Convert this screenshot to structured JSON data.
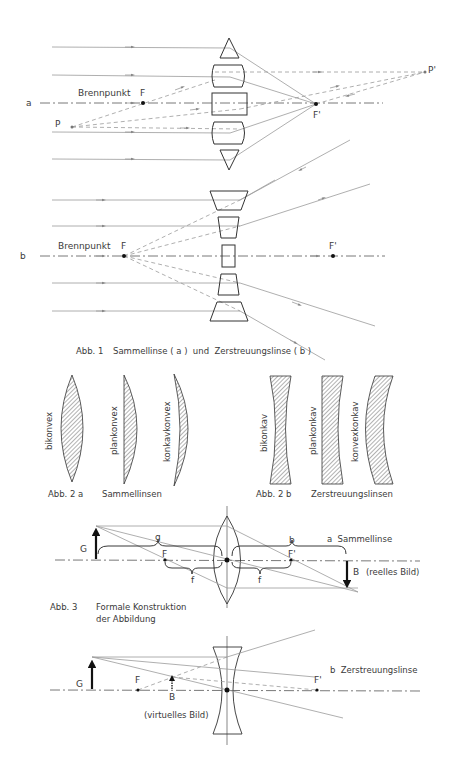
{
  "fig1": {
    "a": {
      "row_label": "a",
      "focal_label": "Brennpunkt",
      "F": "F",
      "F_prime": "F'",
      "P": "P",
      "P_prime": "P'"
    },
    "b": {
      "row_label": "b",
      "focal_label": "Brennpunkt",
      "F": "F",
      "F_prime": "F'"
    },
    "caption_num": "Abb. 1",
    "caption": "Sammellinse ( a )  und  Zerstreuungslinse ( b )"
  },
  "fig2": {
    "a": {
      "lenses": [
        "bikonvex",
        "plankonvex",
        "konkavkonvex"
      ],
      "caption_num": "Abb. 2 a",
      "caption": "Sammellinsen"
    },
    "b": {
      "lenses": [
        "bikonkav",
        "plankonkav",
        "konvexkonkav"
      ],
      "caption_num": "Abb. 2 b",
      "caption": "Zerstreuungslinsen"
    }
  },
  "fig3": {
    "a": {
      "G": "G",
      "g": "g",
      "F": "F",
      "F_prime": "F'",
      "b": "b",
      "f_left": "f",
      "f_right": "f",
      "B": "B",
      "B_note": "(reelles Bild)",
      "title": "a  Sammellinse"
    },
    "caption_num": "Abb. 3",
    "caption_line1": "Formale Konstruktion",
    "caption_line2": "der Abbildung",
    "b": {
      "G": "G",
      "F": "F",
      "B": "B",
      "F_prime": "F'",
      "B_note": "(virtuelles Bild)",
      "title": "b  Zerstreuungslinse"
    }
  }
}
